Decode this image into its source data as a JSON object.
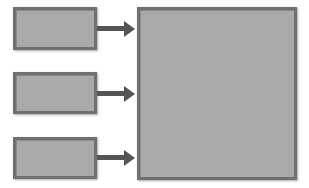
{
  "diagram": {
    "type": "block-diagram",
    "colors": {
      "box_fill": "#a9a9a9",
      "box_border": "#707070",
      "arrow": "#555555",
      "background": "#ffffff"
    },
    "inputs": [
      {
        "id": "input-1",
        "label": ""
      },
      {
        "id": "input-2",
        "label": ""
      },
      {
        "id": "input-3",
        "label": ""
      }
    ],
    "target": {
      "id": "target",
      "label": ""
    },
    "edges": [
      {
        "from": "input-1",
        "to": "target"
      },
      {
        "from": "input-2",
        "to": "target"
      },
      {
        "from": "input-3",
        "to": "target"
      }
    ]
  }
}
